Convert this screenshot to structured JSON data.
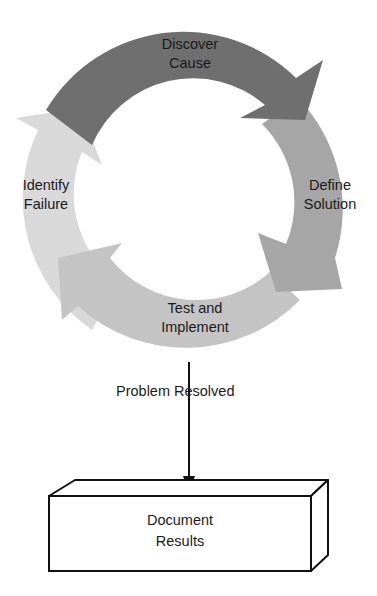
{
  "diagram": {
    "cycle": {
      "steps": [
        {
          "id": "discover",
          "line1": "Discover",
          "line2": "Cause",
          "color": "#6e6e6e"
        },
        {
          "id": "define",
          "line1": "Define",
          "line2": "Solution",
          "color": "#a3a3a3"
        },
        {
          "id": "test",
          "line1": "Test and",
          "line2": "Implement",
          "color": "#bdbdbd"
        },
        {
          "id": "identify",
          "line1": "Identify",
          "line2": "Failure",
          "color": "#d9d9d9"
        }
      ]
    },
    "flow": {
      "label": "Problem Resolved"
    },
    "output": {
      "line1": "Document",
      "line2": "Results"
    }
  }
}
